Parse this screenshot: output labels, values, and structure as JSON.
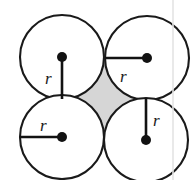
{
  "figure": {
    "canvas": {
      "width": 192,
      "height": 180,
      "background": "#ffffff"
    },
    "stroke_color": "#1a1a1a",
    "fill_color": "#ffffff",
    "interstice_color": "#d6d6d6",
    "seam_color": "#e4e4e4",
    "circle_radius": 42,
    "circles": [
      {
        "name": "top-left",
        "cx": 62,
        "cy": 57,
        "r": 42,
        "center_dot_r": 5,
        "radius_line": {
          "x1": 62,
          "y1": 57,
          "x2": 62,
          "y2": 99,
          "direction": "down"
        },
        "label": {
          "text": "r",
          "x": 45,
          "y": 84
        }
      },
      {
        "name": "top-right",
        "cx": 147,
        "cy": 58,
        "r": 42,
        "center_dot_r": 5,
        "radius_line": {
          "x1": 147,
          "y1": 58,
          "x2": 105,
          "y2": 58,
          "direction": "left"
        },
        "label": {
          "text": "r",
          "x": 120,
          "y": 82
        }
      },
      {
        "name": "bottom-left",
        "cx": 62,
        "cy": 137,
        "r": 42,
        "center_dot_r": 5,
        "radius_line": {
          "x1": 62,
          "y1": 137,
          "x2": 20,
          "y2": 137,
          "direction": "left"
        },
        "label": {
          "text": "r",
          "x": 40,
          "y": 131
        }
      },
      {
        "name": "bottom-right",
        "cx": 146,
        "cy": 140,
        "r": 42,
        "center_dot_r": 5,
        "radius_line": {
          "x1": 146,
          "y1": 140,
          "x2": 146,
          "y2": 98,
          "direction": "up"
        },
        "label": {
          "text": "r",
          "x": 153,
          "y": 126
        }
      }
    ],
    "interstice": {
      "name": "central-void",
      "fill": "#d6d6d6",
      "tangent_points": [
        {
          "name": "top",
          "x": 104,
          "y": 57
        },
        {
          "name": "right",
          "x": 146,
          "y": 99
        },
        {
          "name": "bottom",
          "x": 104,
          "y": 138
        },
        {
          "name": "left",
          "x": 62,
          "y": 98
        }
      ]
    },
    "page_seam": {
      "x": 173,
      "y1": 0,
      "y2": 180
    },
    "labels": {
      "radius_symbol": "r"
    }
  }
}
